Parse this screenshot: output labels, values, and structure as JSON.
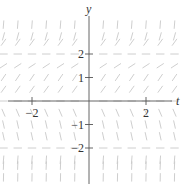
{
  "chart_data": {
    "type": "slope_field",
    "title": "",
    "xlabel": "t",
    "ylabel": "y",
    "x_ticks": [
      -2,
      2
    ],
    "x_tick_labels": [
      "−2",
      "2"
    ],
    "y_ticks": [
      2,
      1,
      -1,
      -2
    ],
    "y_tick_labels": [
      "2",
      "1",
      "−1",
      "−2"
    ],
    "xlim": [
      -3.1,
      3.1
    ],
    "ylim": [
      -3.4,
      3.4
    ],
    "grid": false,
    "equilibria": [
      -2,
      0,
      2
    ],
    "slope_sign_by_region": [
      {
        "region": "y > 2",
        "slope": "positive (steep)"
      },
      {
        "region": "y = 2",
        "slope": "zero"
      },
      {
        "region": "0 < y < 2",
        "slope": "positive"
      },
      {
        "region": "y = 0",
        "slope": "zero"
      },
      {
        "region": "-2 < y < 0",
        "slope": "negative"
      },
      {
        "region": "y = -2",
        "slope": "zero"
      },
      {
        "region": "y < -2",
        "slope": "positive (steep)"
      }
    ],
    "field_t_values": [
      -3,
      -2.5,
      -2,
      -1.5,
      -1,
      -0.5,
      0,
      0.5,
      1,
      1.5,
      2,
      2.5,
      3
    ],
    "field_y_values": [
      -3.25,
      -2.75,
      -2.5,
      -2,
      -1.5,
      -1,
      -0.5,
      0,
      0.5,
      1,
      1.5,
      2,
      2.5,
      2.75,
      3.25
    ]
  },
  "colors": {
    "axis": "#555555",
    "field": "#c8c8c8",
    "text": "#333333"
  }
}
